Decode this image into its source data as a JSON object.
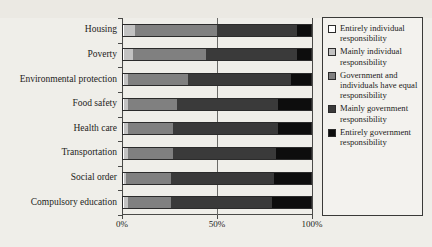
{
  "chart_data": {
    "type": "bar",
    "subtype": "horizontal-100-percent-stacked",
    "title": "",
    "xlabel": "",
    "ylabel": "",
    "xlim": [
      0,
      100
    ],
    "xticks": [
      0,
      50,
      100
    ],
    "xtick_labels": [
      "0%",
      "50%",
      "100%"
    ],
    "grid": true,
    "grid_axis": "x",
    "legend_position": "right",
    "categories": [
      "Housing",
      "Poverty",
      "Environmental protection",
      "Food safety",
      "Health care",
      "Transportation",
      "Social order",
      "Compulsory education"
    ],
    "series": [
      {
        "name": "Entirely individual responsibility",
        "color": "#ffffff",
        "values": [
          1,
          1,
          1,
          1,
          1,
          1,
          1,
          1
        ]
      },
      {
        "name": "Mainly individual responsibility",
        "color": "#c2c2c2",
        "values": [
          6,
          5,
          2,
          2,
          2,
          2,
          1,
          2
        ]
      },
      {
        "name": "Government and individuals have equal responsibility",
        "color": "#808080",
        "values": [
          43,
          38,
          32,
          26,
          24,
          24,
          24,
          23
        ]
      },
      {
        "name": "Mainly government responsibility",
        "color": "#3a3a3a",
        "values": [
          42,
          48,
          54,
          53,
          55,
          54,
          54,
          53
        ]
      },
      {
        "name": "Entirely government responsibility",
        "color": "#0d0d0d",
        "values": [
          8,
          8,
          11,
          18,
          18,
          19,
          20,
          21
        ]
      }
    ]
  },
  "legend": {
    "items": [
      {
        "label": "Entirely individual responsibility",
        "swatch": "#ffffff"
      },
      {
        "label": "Mainly individual responsibility",
        "swatch": "#c2c2c2"
      },
      {
        "label": "Government and individuals have equal responsibility",
        "swatch": "#808080"
      },
      {
        "label": "Mainly government responsibility",
        "swatch": "#3a3a3a"
      },
      {
        "label": "Entirely government responsibility",
        "swatch": "#0d0d0d"
      }
    ]
  },
  "axis": {
    "x_tick_labels": [
      "0%",
      "50%",
      "100%"
    ]
  }
}
